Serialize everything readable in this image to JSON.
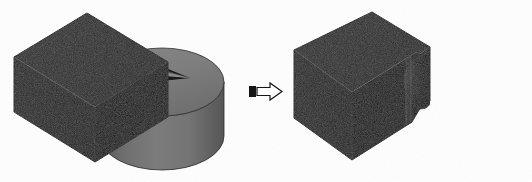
{
  "figure": {
    "title": "Boolean subtraction of a cylinder from a rectangular block",
    "background_color": "#fdfdfd",
    "width": 532,
    "height": 182,
    "noise_overlay": true
  },
  "operation": {
    "type": "subtract",
    "symbol_name": "right-arrow-icon",
    "symbol_glyph": "⇒",
    "arrow": {
      "outline_color": "#1a1a1a",
      "fill_color": "#fefefe",
      "tail_block_color": "#141414",
      "x": 249,
      "y": 83,
      "width": 33,
      "height": 17
    }
  },
  "colors": {
    "block_top": "#2b2b2b",
    "block_front": "#242424",
    "block_side": "#191919",
    "block_edge": "#4a4a4a",
    "cylinder_top": "#7e7e7e",
    "cylinder_side_light": "#7a7a7a",
    "cylinder_side_dark": "#5d5d5d",
    "wedge_face_a": "#3a3a3a",
    "wedge_face_b": "#8a8a8a",
    "notch_shadow": "#0e0e0e",
    "notch_highlight": "#313131",
    "background": "#fdfdfd",
    "outline": "#000000"
  },
  "input_scene": {
    "name": "input-assembly",
    "label": "Block and cylinder before subtraction",
    "solids": [
      {
        "name": "rectangular-block",
        "label": "Rectangular block (tool body)",
        "shade": "dark",
        "visible_faces": [
          "top",
          "front",
          "right-end"
        ]
      },
      {
        "name": "cylinder",
        "label": "Cylinder with pie-wedge cut",
        "shade": "gray",
        "visible_faces": [
          "top-disc",
          "lateral-surface"
        ],
        "cut_feature": {
          "name": "pie-wedge-notch",
          "label": "Pie-wedge notch",
          "shape": "triangular-wedge"
        }
      }
    ]
  },
  "result_scene": {
    "name": "result-solid",
    "label": "Resulting block with concave cylindrical notch",
    "solids": [
      {
        "name": "result-block",
        "label": "Block after subtraction",
        "shade": "dark",
        "visible_faces": [
          "top",
          "front",
          "right-end",
          "slot-wall"
        ],
        "cut_feature": {
          "name": "concave-cylindrical-pocket",
          "label": "Concave cylindrical pocket",
          "shape": "cylindrical-scallop"
        }
      }
    ]
  },
  "annotations": {
    "left_label": "",
    "right_label": "",
    "operator_label": ""
  }
}
